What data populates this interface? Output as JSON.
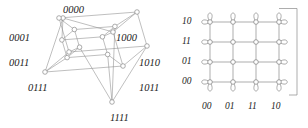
{
  "figure": {
    "kind": "graph-diagram-pair",
    "stroke_color": "#8a8a8a",
    "node_fill": "#ffffff",
    "node_stroke": "#8a8a8a",
    "label_color": "#1a1a1a",
    "background": "#ffffff"
  },
  "hypercube": {
    "name": "4-dimensional hypercube graph",
    "labels": [
      {
        "id": "0000",
        "text": "0000",
        "x": 63,
        "y": 4,
        "anchor": "bottom-node"
      },
      {
        "id": "0001",
        "text": "0001",
        "x": 9,
        "y": 32,
        "anchor": "left-node"
      },
      {
        "id": "0011",
        "text": "0011",
        "x": 9,
        "y": 57,
        "anchor": "left-node"
      },
      {
        "id": "0111",
        "text": "0111",
        "x": 28,
        "y": 82,
        "anchor": "left-node"
      },
      {
        "id": "1111",
        "text": "1111",
        "x": 110,
        "y": 112,
        "anchor": "top-node"
      },
      {
        "id": "1000",
        "text": "1000",
        "x": 116,
        "y": 32,
        "anchor": "right-node"
      },
      {
        "id": "1010",
        "text": "1010",
        "x": 139,
        "y": 57,
        "anchor": "right-node"
      },
      {
        "id": "1011",
        "text": "1011",
        "x": 139,
        "y": 82,
        "anchor": "right-node"
      }
    ]
  },
  "torus": {
    "name": "4 by 4 torus grid graph",
    "row_labels": [
      "10",
      "11",
      "01",
      "00"
    ],
    "column_labels": [
      "00",
      "01",
      "11",
      "10"
    ],
    "rows": 4,
    "columns": 4
  }
}
